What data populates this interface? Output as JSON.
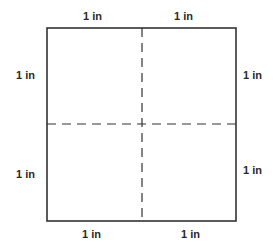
{
  "diagram": {
    "labels": {
      "top_left": "1 in",
      "top_right": "1 in",
      "left_upper": "1 in",
      "left_lower": "1 in",
      "right_upper": "1 in",
      "right_lower": "1 in",
      "bottom_left": "1 in",
      "bottom_right": "1 in"
    },
    "colors": {
      "line": "#333333",
      "text": "#2a2a2a",
      "background": "#ffffff"
    }
  }
}
